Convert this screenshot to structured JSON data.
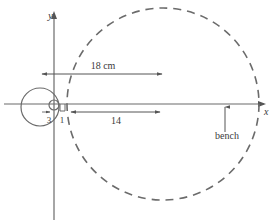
{
  "diagram": {
    "type": "geometry-figure",
    "axes": {
      "x_label": "x",
      "y_label": "y"
    },
    "labels": {
      "distance_top": "18 cm",
      "distance_bottom": "14",
      "small_gap": "1",
      "small_radius": "3",
      "bench": "bench"
    },
    "shapes": {
      "small_circle": {
        "description": "small solid circle at origin"
      },
      "medium_circle": {
        "description": "solid circle of radius 3 left of y-axis"
      },
      "large_dashed_circle": {
        "description": "large dashed circle, diameter 18 cm"
      },
      "bench_line": {
        "description": "horizontal line along x-axis representing bench"
      }
    },
    "colors": {
      "stroke": "#6b6b6b",
      "text": "#3a3a3a"
    }
  }
}
